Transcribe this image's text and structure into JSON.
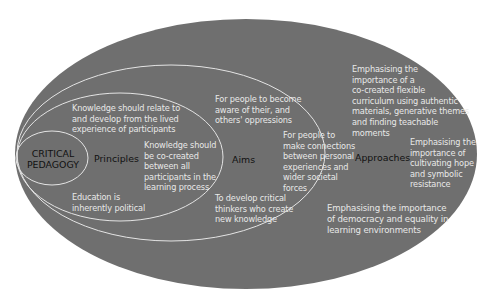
{
  "colors": {
    "outer_fill": "#6f6f6f",
    "ring_stroke": "#e4e4e4",
    "text_light": "#e8e8e8",
    "text_dark": "#111111",
    "background": "#ffffff"
  },
  "core": {
    "label_line1": "CRITICAL",
    "label_line2": "PEDAGOGY"
  },
  "principles": {
    "label": "Principles",
    "items": [
      {
        "lines": [
          "Knowledge should relate to",
          "and develop from the lived",
          "experience of participants"
        ]
      },
      {
        "lines": [
          "Knowledge should",
          "be co-created",
          "between all",
          "participants in the",
          "learning process"
        ]
      },
      {
        "lines": [
          "Education is",
          "inherently political"
        ]
      }
    ]
  },
  "aims": {
    "label": "Aims",
    "items": [
      {
        "lines": [
          "For people to become",
          "aware of their, and",
          "others' oppressions"
        ]
      },
      {
        "lines": [
          "For people to",
          "make connections",
          "between personal",
          "experiences and",
          "wider societal",
          "forces"
        ]
      },
      {
        "lines": [
          "To develop critical",
          "thinkers who create",
          "new knowledge"
        ]
      }
    ]
  },
  "approaches": {
    "label": "Approaches",
    "items": [
      {
        "lines": [
          "Emphasising  the",
          "importance  of a",
          "co-created flexible",
          "curriculum using authentic",
          "materials, generative themes",
          "and finding teachable",
          "moments"
        ]
      },
      {
        "lines": [
          "Emphasising  the",
          "importance of",
          "cultivating hope",
          "and symbolic",
          "resistance"
        ]
      },
      {
        "lines": [
          "Emphasising the importance",
          "of democracy and equality in",
          "learning environments"
        ]
      }
    ]
  }
}
